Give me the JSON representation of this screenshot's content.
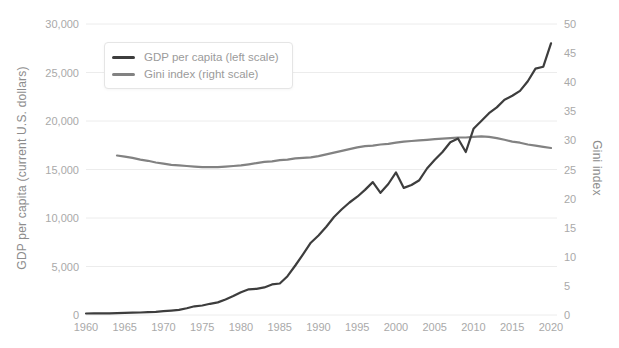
{
  "colors": {
    "background": "#ffffff",
    "grid": "#ececec",
    "tick_text": "#a9a9a9",
    "axis_title_text": "#8c8c8c",
    "legend_text": "#9b9b9b",
    "legend_border": "#e5e5e5",
    "gdp_line": "#3d3d3d",
    "gini_line": "#828282"
  },
  "chart_data": {
    "type": "line",
    "title": "",
    "grid": "horizontal",
    "legend": {
      "position": "top-left",
      "items": [
        {
          "label": "GDP per capita (left scale)",
          "color": "#3d3d3d"
        },
        {
          "label": "Gini index (right scale)",
          "color": "#828282"
        }
      ]
    },
    "x_axis": {
      "range": [
        1960,
        2021
      ],
      "tick_years": [
        1960,
        1965,
        1970,
        1975,
        1980,
        1985,
        1990,
        1995,
        2000,
        2005,
        2010,
        2015,
        2020
      ],
      "tick_labels": [
        "1960",
        "1965",
        "1970",
        "1975",
        "1980",
        "1985",
        "1990",
        "1995",
        "2000",
        "2005",
        "2010",
        "2015",
        "2020"
      ]
    },
    "left_axis": {
      "label": "GDP per capita (current U.S. dollars)",
      "range": [
        0,
        30000
      ],
      "tick_values": [
        0,
        5000,
        10000,
        15000,
        20000,
        25000,
        30000
      ],
      "tick_labels": [
        "0",
        "5,000",
        "10,000",
        "15,000",
        "20,000",
        "25,000",
        "30,000"
      ]
    },
    "right_axis": {
      "label": "Gini index",
      "range": [
        0,
        50
      ],
      "tick_values": [
        0,
        5,
        10,
        15,
        20,
        25,
        30,
        35,
        40,
        45,
        50
      ],
      "tick_labels": [
        "0",
        "5",
        "10",
        "15",
        "20",
        "25",
        "30",
        "35",
        "40",
        "45",
        "50"
      ]
    },
    "series": [
      {
        "name": "GDP per capita (left scale)",
        "axis": "left",
        "color": "#3d3d3d",
        "start_year": 1960,
        "end_year": 2020,
        "interval_years": 1,
        "values": [
          150,
          160,
          170,
          180,
          200,
          220,
          240,
          260,
          290,
          330,
          390,
          450,
          530,
          700,
          900,
          980,
          1150,
          1300,
          1600,
          1950,
          2350,
          2650,
          2700,
          2850,
          3150,
          3250,
          4000,
          5100,
          6250,
          7450,
          8200,
          9100,
          10100,
          10900,
          11600,
          12200,
          12900,
          13700,
          12600,
          13500,
          14700,
          13100,
          13400,
          13900,
          15100,
          16000,
          16800,
          17800,
          18200,
          16800,
          19200,
          20000,
          20800,
          21400,
          22200,
          22600,
          23100,
          24100,
          25400,
          25600,
          28000
        ]
      },
      {
        "name": "Gini index (right scale)",
        "axis": "right",
        "color": "#828282",
        "start_year": 1964,
        "end_year": 2020,
        "interval_years": 1,
        "values": [
          27.4,
          27.2,
          27.0,
          26.7,
          26.5,
          26.2,
          26.0,
          25.8,
          25.7,
          25.6,
          25.5,
          25.4,
          25.4,
          25.4,
          25.5,
          25.6,
          25.7,
          25.9,
          26.1,
          26.3,
          26.4,
          26.6,
          26.7,
          26.9,
          27.0,
          27.1,
          27.3,
          27.6,
          27.9,
          28.2,
          28.5,
          28.8,
          29.0,
          29.1,
          29.3,
          29.4,
          29.6,
          29.8,
          29.9,
          30.0,
          30.1,
          30.2,
          30.3,
          30.4,
          30.5,
          30.5,
          30.6,
          30.7,
          30.6,
          30.4,
          30.1,
          29.8,
          29.6,
          29.3,
          29.1,
          28.9,
          28.7
        ]
      }
    ]
  }
}
